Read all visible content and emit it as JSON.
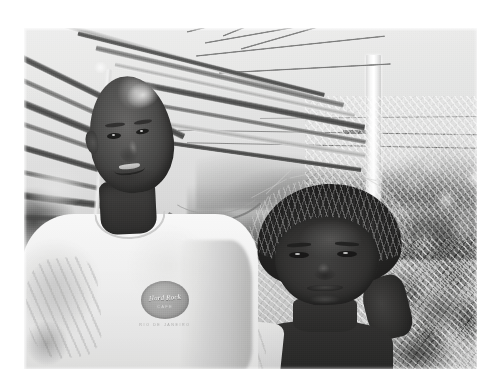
{
  "page": {
    "background_color": "#ffffff",
    "width": 491,
    "height": 386,
    "type": "scanned-photograph"
  },
  "photo": {
    "name": "family-portrait-photo",
    "left": 24,
    "top": 28,
    "width": 453,
    "height": 341,
    "treatment": "black-and-white",
    "caption_visible": "",
    "subjects": [
      {
        "id": "man",
        "description": "Adult man with shaved head, smiling, wearing a white short-sleeve t-shirt",
        "position": "left-foreground"
      },
      {
        "id": "girl",
        "description": "Young girl with short twisted braids, looking at camera, light sleeveless top",
        "position": "right-foreground"
      }
    ],
    "background_elements": [
      "dried palm fronds",
      "white utility pole",
      "overhead power lines",
      "tropical foliage",
      "distant hills",
      "overcast sky"
    ]
  },
  "shirt_logo": {
    "name": "hard-rock-cafe-logo",
    "top_text": "",
    "brand": "Hard Rock",
    "sub_text": "CAFE",
    "city_text": "RIO DE JANEIRO",
    "shape": "circular-emblem"
  },
  "colors": {
    "page_background": "#ffffff",
    "photo_sky": "#e2e3df",
    "photo_shadow": "#2c2620",
    "photo_midtone": "#8d9287",
    "photo_highlight": "#fbfbf8"
  }
}
